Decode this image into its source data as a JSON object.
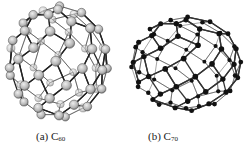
{
  "figure": {
    "panels": [
      {
        "id": "a",
        "label_prefix": "(a) C",
        "label_subscript": "60",
        "molecule": "C60 fullerene",
        "style": "ball-and-stick, large grey shaded atoms",
        "atom_color": "#bdbdbd",
        "bond_color": "#222222",
        "center": [
          58,
          62
        ],
        "radius": [
          50,
          56
        ]
      },
      {
        "id": "b",
        "label_prefix": "(b) C",
        "label_subscript": "70",
        "molecule": "C70 fullerene",
        "style": "ball-and-stick, small black atoms",
        "atom_color": "#111111",
        "bond_color": "#333333",
        "center": [
          61,
          64
        ],
        "radius": [
          55,
          47
        ]
      }
    ]
  }
}
